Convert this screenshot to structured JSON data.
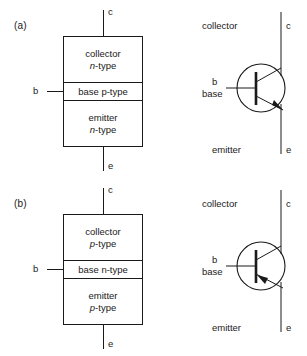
{
  "figure": {
    "stroke_color": "#1a1a1a",
    "background_color": "#ffffff"
  },
  "panels": [
    {
      "label": "(a)",
      "device_type": "npn",
      "arrow_direction": "outward",
      "block": {
        "terminal_top": "c",
        "terminal_bottom": "e",
        "terminal_side": "b",
        "regions": [
          {
            "name": "collector",
            "line1": "collector",
            "doping_prefix": "n",
            "doping_suffix": "-type",
            "doping_italic": true
          },
          {
            "name": "base",
            "line1": "base p-type",
            "doping_prefix": "",
            "doping_suffix": "",
            "doping_italic": false
          },
          {
            "name": "emitter",
            "line1": "emitter",
            "doping_prefix": "n",
            "doping_suffix": "-type",
            "doping_italic": true
          }
        ]
      },
      "symbol": {
        "collector_label": "collector",
        "collector_terminal": "c",
        "emitter_label": "emitter",
        "emitter_terminal": "e",
        "base_terminal": "b",
        "base_label": "base"
      }
    },
    {
      "label": "(b)",
      "device_type": "pnp",
      "arrow_direction": "inward",
      "block": {
        "terminal_top": "c",
        "terminal_bottom": "e",
        "terminal_side": "b",
        "regions": [
          {
            "name": "collector",
            "line1": "collector",
            "doping_prefix": "p",
            "doping_suffix": "-type",
            "doping_italic": true
          },
          {
            "name": "base",
            "line1": "base n-type",
            "doping_prefix": "",
            "doping_suffix": "",
            "doping_italic": false
          },
          {
            "name": "emitter",
            "line1": "emitter",
            "doping_prefix": "p",
            "doping_suffix": "-type",
            "doping_italic": true
          }
        ]
      },
      "symbol": {
        "collector_label": "collector",
        "collector_terminal": "c",
        "emitter_label": "emitter",
        "emitter_terminal": "e",
        "base_terminal": "b",
        "base_label": "base"
      }
    }
  ]
}
